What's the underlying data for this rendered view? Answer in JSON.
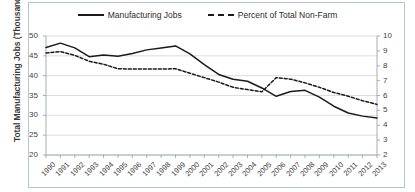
{
  "chart_data": {
    "type": "line",
    "title": "",
    "xlabel": "",
    "ylabel": "Total Manufacturing Jobs (Thousands)",
    "y2label": "",
    "grid": true,
    "legend_position": "top",
    "x": [
      "1990",
      "1991",
      "1992",
      "1993",
      "1994",
      "1995",
      "1996",
      "1997",
      "1998",
      "1999",
      "2000",
      "2001",
      "2002",
      "2003",
      "2004",
      "2005",
      "2006",
      "2007",
      "2008",
      "2009",
      "2010",
      "2011",
      "2012",
      "2013"
    ],
    "ylim": [
      20,
      50
    ],
    "y2lim": [
      2,
      10
    ],
    "yticks": [
      20,
      25,
      30,
      35,
      40,
      45,
      50
    ],
    "y2ticks": [
      2,
      3,
      4,
      5,
      6,
      7,
      8,
      9,
      10
    ],
    "series": [
      {
        "name": "Manufacturing Jobs",
        "axis": "left",
        "style": "solid",
        "color": "#1a1a1a",
        "values": [
          47.1,
          48.2,
          47.0,
          44.8,
          45.2,
          44.9,
          45.6,
          46.5,
          47.0,
          47.5,
          45.5,
          42.8,
          40.3,
          39.1,
          38.6,
          36.9,
          34.8,
          36.0,
          36.3,
          34.6,
          32.3,
          30.6,
          29.8,
          29.3
        ]
      },
      {
        "name": "Percent of Total Non-Farm",
        "axis": "right",
        "style": "dashed",
        "color": "#1a1a1a",
        "values": [
          8.85,
          8.95,
          8.7,
          8.3,
          8.1,
          7.8,
          7.78,
          7.78,
          7.78,
          7.8,
          7.5,
          7.2,
          6.9,
          6.55,
          6.4,
          6.25,
          7.2,
          7.1,
          6.85,
          6.55,
          6.2,
          5.95,
          5.65,
          5.4
        ]
      }
    ]
  }
}
